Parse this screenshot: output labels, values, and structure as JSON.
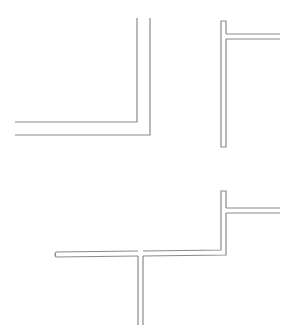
{
  "diagram": {
    "background": "#ffffff",
    "stroke_color": "#8a8a8a",
    "stroke_width": 1.2,
    "shapes": [
      {
        "name": "l-corner-wall",
        "description": "Double-line L-shaped corner (vertical down then horizontal left)",
        "paths": [
          "M137 18 L137 122 L15 122",
          "M150 18 L150 135 L15 135"
        ]
      },
      {
        "name": "t-junction-wall-top-right",
        "description": "Closed vertical double-line bar with horizontal double-line branch to the right",
        "paths": [
          "M226 34 L280 34",
          "M226 39 L280 39",
          "M226 34 L226 21 L221 21 L221 147 L226 147 L226 39"
        ]
      },
      {
        "name": "stepped-wall-with-stem",
        "description": "Stepped double-line wall with right branch at top and downward stem",
        "paths": [
          "M226 208 L280 208",
          "M226 213 L280 213",
          "M226 208 L226 191 L221 191 L221 250 L143 251",
          "M226 213 L226 255 L143 256",
          "M138 251 L56 252 Q54 254.5 56 257 L138 256",
          "M138 256 L138 325",
          "M143 256 L143 325"
        ]
      }
    ]
  }
}
